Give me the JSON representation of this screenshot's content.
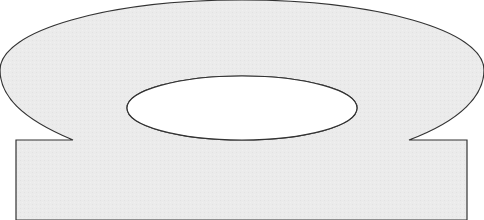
{
  "figure": {
    "colors": {
      "fill": "#ebebeb",
      "stroke": "#333333",
      "hole": "#ffffff",
      "background": "#ffffff"
    },
    "outer_ellipse": {
      "cx": 242,
      "cy": 70,
      "rx": 242,
      "ry": 70
    },
    "hole_ellipse": {
      "cx": 242,
      "cy": 108,
      "rx": 115,
      "ry": 32
    },
    "base_rect": {
      "x": 16,
      "y": 140,
      "width": 451,
      "height": 80
    },
    "notches": [
      {
        "x": 73,
        "y": 140
      },
      {
        "x": 409,
        "y": 140
      }
    ]
  }
}
